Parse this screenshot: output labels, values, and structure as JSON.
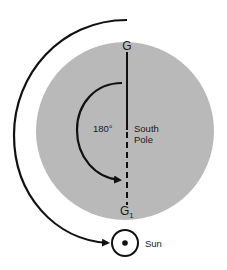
{
  "diagram": {
    "labels": {
      "top_point": "G",
      "bottom_point_base": "G",
      "bottom_point_subscript": "1",
      "angle": "180°",
      "pole_line1": "South",
      "pole_line2": "Pole",
      "sun": "Sun"
    },
    "rotation_degrees": 180,
    "colors": {
      "earth_disk": "#b9b9b9",
      "line": "#111111",
      "background": "#ffffff"
    }
  }
}
